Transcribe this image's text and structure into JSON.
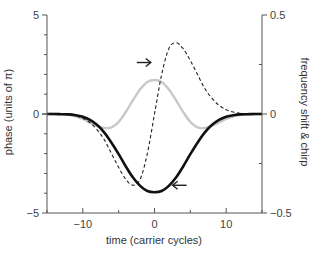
{
  "chart_data": {
    "type": "line",
    "title": "",
    "xlabel": "time (carrier cycles)",
    "ylabel": "phase (units of π)",
    "ylabel_right": "frequency shift & chirp",
    "xlim": [
      -15,
      15
    ],
    "ylim": [
      -5,
      5
    ],
    "ylim_right": [
      -0.5,
      0.5
    ],
    "grid": false,
    "legend": null,
    "x_ticks": [
      {
        "value": -10,
        "label": "−10"
      },
      {
        "value": 0,
        "label": "0"
      },
      {
        "value": 10,
        "label": "10"
      }
    ],
    "x_minor_ticks": [
      -15,
      -5,
      5,
      15
    ],
    "y_ticks": [
      {
        "value": 5,
        "label": "5"
      },
      {
        "value": 0,
        "label": "0"
      },
      {
        "value": -5,
        "label": "−5"
      }
    ],
    "y_minor_ticks": [
      4,
      3,
      2,
      1,
      -1,
      -2,
      -3,
      -4
    ],
    "y_right_ticks": [
      {
        "value": 0.5,
        "label": "0.5"
      },
      {
        "value": 0,
        "label": "0"
      },
      {
        "value": -0.5,
        "label": "−0.5"
      }
    ],
    "y_right_minor_ticks": [
      0.25,
      -0.25
    ],
    "series": [
      {
        "name": "phase",
        "axis": "left",
        "style": "solid-black-thick",
        "color": "#111111",
        "x": [
          -15,
          -14,
          -13,
          -12,
          -11,
          -10,
          -9,
          -8,
          -7,
          -6,
          -5,
          -4,
          -3,
          -2,
          -1,
          0,
          1,
          2,
          3,
          4,
          5,
          6,
          7,
          8,
          9,
          10,
          11,
          12,
          13,
          14,
          15
        ],
        "values": [
          0,
          0,
          -0.01,
          -0.02,
          -0.06,
          -0.14,
          -0.3,
          -0.56,
          -0.94,
          -1.45,
          -2.03,
          -2.65,
          -3.21,
          -3.63,
          -3.89,
          -3.95,
          -3.89,
          -3.63,
          -3.21,
          -2.65,
          -2.03,
          -1.45,
          -0.94,
          -0.56,
          -0.3,
          -0.14,
          -0.06,
          -0.02,
          -0.01,
          0,
          0
        ]
      },
      {
        "name": "frequency shift",
        "axis": "right",
        "style": "solid-gray",
        "color": "#c8c8c8",
        "x": [
          -15,
          -14,
          -13,
          -12,
          -11,
          -10,
          -9,
          -8,
          -7,
          -6,
          -5,
          -4,
          -3,
          -2,
          -1,
          0,
          1,
          2,
          3,
          4,
          5,
          6,
          7,
          8,
          9,
          10,
          11,
          12,
          13,
          14,
          15
        ],
        "values": [
          0,
          0,
          -0.001,
          -0.004,
          -0.012,
          -0.025,
          -0.043,
          -0.06,
          -0.07,
          -0.068,
          -0.04,
          0.01,
          0.07,
          0.125,
          0.162,
          0.172,
          0.162,
          0.125,
          0.07,
          0.01,
          -0.04,
          -0.068,
          -0.07,
          -0.06,
          -0.043,
          -0.025,
          -0.012,
          -0.004,
          -0.001,
          0,
          0
        ]
      },
      {
        "name": "chirp",
        "axis": "right",
        "style": "dashed-black",
        "color": "#222222",
        "x": [
          -15,
          -14,
          -13,
          -12,
          -11,
          -10,
          -9,
          -8,
          -7,
          -6,
          -5,
          -4,
          -3,
          -2,
          -1,
          0,
          1,
          2,
          3,
          4,
          5,
          6,
          7,
          8,
          9,
          10,
          11,
          12,
          13,
          14,
          15
        ],
        "values": [
          0,
          0,
          -0.001,
          -0.004,
          -0.01,
          -0.022,
          -0.044,
          -0.08,
          -0.13,
          -0.2,
          -0.27,
          -0.33,
          -0.36,
          -0.33,
          -0.2,
          0,
          0.2,
          0.33,
          0.36,
          0.33,
          0.27,
          0.2,
          0.13,
          0.08,
          0.044,
          0.022,
          0.01,
          0.004,
          0.001,
          0,
          0
        ]
      }
    ],
    "annotations": [
      {
        "type": "arrow",
        "direction": "right",
        "x": -1.5,
        "y": 2.6,
        "glyph": "→"
      },
      {
        "type": "arrow",
        "direction": "left",
        "x": 3.5,
        "y": -3.6,
        "glyph": "←"
      }
    ]
  },
  "labels": {
    "x_axis": "time (carrier cycles)",
    "y_axis_left": "phase (units of π)",
    "y_axis_right": "frequency shift & chirp"
  }
}
